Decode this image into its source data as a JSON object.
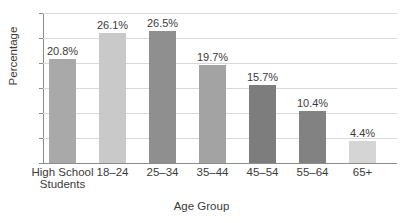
{
  "chart_data": {
    "type": "bar",
    "title": "",
    "xlabel": "Age Group",
    "ylabel": "Percentage",
    "categories": [
      "High School Students",
      "18–24",
      "25–34",
      "35–44",
      "45–54",
      "55–64",
      "65+"
    ],
    "category_lines": [
      [
        "High School",
        "Students"
      ],
      [
        "18–24",
        ""
      ],
      [
        "25–34",
        ""
      ],
      [
        "35–44",
        ""
      ],
      [
        "45–54",
        ""
      ],
      [
        "55–64",
        ""
      ],
      [
        "65+",
        ""
      ]
    ],
    "values": [
      20.8,
      26.1,
      26.5,
      19.7,
      15.7,
      10.4,
      4.4
    ],
    "data_labels": [
      "20.8%",
      "26.1%",
      "26.5%",
      "19.7%",
      "15.7%",
      "10.4%",
      "4.4%"
    ],
    "bar_colors": [
      "#a9a9a9",
      "#c9c9c9",
      "#8f8f8f",
      "#a3a3a3",
      "#7d7d7d",
      "#828282",
      "#d5d5d5"
    ],
    "ylim": [
      0,
      30
    ],
    "ytick_labels": [
      "0",
      "5",
      "10",
      "15",
      "20",
      "25",
      "30"
    ],
    "ytick_values": [
      0,
      5,
      10,
      15,
      20,
      25,
      30
    ],
    "grid": true,
    "legend": false,
    "axis_color": "#8c8c8c",
    "gridline_color": "#d9d9d9",
    "text_color": "#3b3b3b"
  }
}
